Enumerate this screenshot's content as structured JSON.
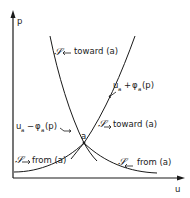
{
  "diagram": {
    "axes": {
      "x_label": "u",
      "y_label": "p"
    },
    "point": {
      "label": "a"
    },
    "curves": {
      "plus": {
        "expr_u": "u",
        "expr_u_sub": "a",
        "expr_op": "+",
        "expr_phi": "φ",
        "expr_phi_sub": "a",
        "expr_arg": "(p)"
      },
      "minus": {
        "expr_u": "u",
        "expr_u_sub": "a",
        "expr_op": "−",
        "expr_phi": "φ",
        "expr_phi_sub": "a",
        "expr_arg": "(p)"
      }
    },
    "labels": {
      "top_left": {
        "symbol": "𝒮",
        "arrow": "←",
        "text": "toward (a)"
      },
      "mid_right": {
        "symbol": "𝒮",
        "arrow": "→",
        "text": "toward (a)"
      },
      "bottom_left": {
        "symbol": "𝒮",
        "arrow": "→",
        "text": "from (a)"
      },
      "bottom_right": {
        "symbol": "𝒮",
        "arrow": "←",
        "text": "from (a)"
      }
    }
  }
}
